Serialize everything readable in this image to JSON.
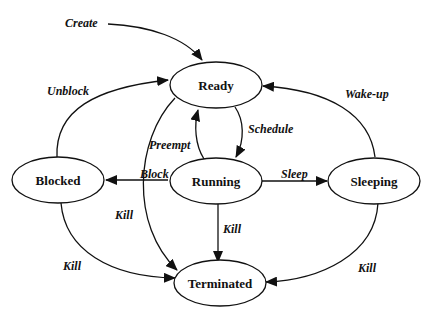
{
  "diagram": {
    "type": "state-transition",
    "nodes": {
      "ready": "Ready",
      "running": "Running",
      "blocked": "Blocked",
      "sleeping": "Sleeping",
      "terminated": "Terminated"
    },
    "edges": {
      "create": "Create",
      "unblock": "Unblock",
      "wakeup": "Wake-up",
      "preempt": "Preempt",
      "schedule": "Schedule",
      "block": "Block",
      "sleep": "Sleep",
      "kill_ready": "Kill",
      "kill_running": "Kill",
      "kill_blocked": "Kill",
      "kill_sleeping": "Kill"
    },
    "transitions": [
      {
        "from": "(start)",
        "to": "Ready",
        "label": "Create"
      },
      {
        "from": "Blocked",
        "to": "Ready",
        "label": "Unblock"
      },
      {
        "from": "Sleeping",
        "to": "Ready",
        "label": "Wake-up"
      },
      {
        "from": "Running",
        "to": "Ready",
        "label": "Preempt"
      },
      {
        "from": "Ready",
        "to": "Running",
        "label": "Schedule"
      },
      {
        "from": "Running",
        "to": "Blocked",
        "label": "Block"
      },
      {
        "from": "Running",
        "to": "Sleeping",
        "label": "Sleep"
      },
      {
        "from": "Ready",
        "to": "Terminated",
        "label": "Kill"
      },
      {
        "from": "Running",
        "to": "Terminated",
        "label": "Kill"
      },
      {
        "from": "Blocked",
        "to": "Terminated",
        "label": "Kill"
      },
      {
        "from": "Sleeping",
        "to": "Terminated",
        "label": "Kill"
      }
    ]
  }
}
